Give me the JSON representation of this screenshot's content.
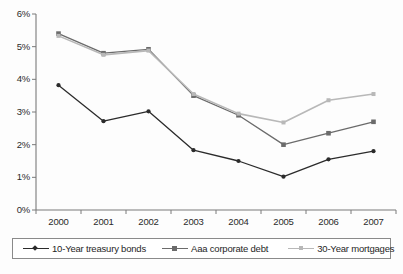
{
  "chart_data": {
    "type": "line",
    "title": "",
    "subtitle": "",
    "xlabel": "",
    "ylabel": "",
    "categories": [
      "2000",
      "2001",
      "2002",
      "2003",
      "2004",
      "2005",
      "2006",
      "2007"
    ],
    "x": [
      2000,
      2001,
      2002,
      2003,
      2004,
      2005,
      2006,
      2007
    ],
    "ylim": [
      0,
      6
    ],
    "yticks": [
      0,
      1,
      2,
      3,
      4,
      5,
      6
    ],
    "ytick_labels": [
      "0%",
      "1%",
      "2%",
      "3%",
      "4%",
      "5%",
      "6%"
    ],
    "grid": false,
    "legend_position": "bottom",
    "series": [
      {
        "name": "10-Year treasury bonds",
        "color": "#2b2b2b",
        "marker": "diamond",
        "values": [
          3.82,
          2.72,
          3.02,
          1.83,
          1.5,
          1.02,
          1.55,
          1.8
        ]
      },
      {
        "name": "Aaa corporate debt",
        "color": "#6b6b6b",
        "marker": "square",
        "values": [
          5.4,
          4.8,
          4.92,
          3.5,
          2.9,
          2.0,
          2.35,
          2.7
        ]
      },
      {
        "name": "30-Year mortgages",
        "color": "#b8b8b8",
        "marker": "square",
        "values": [
          5.33,
          4.75,
          4.88,
          3.55,
          2.95,
          2.68,
          3.36,
          3.55
        ]
      }
    ]
  },
  "axis": {
    "y_tick_labels": [
      "6%",
      "5%",
      "4%",
      "3%",
      "2%",
      "1%",
      "0%"
    ],
    "x_tick_labels": [
      "2000",
      "2001",
      "2002",
      "2003",
      "2004",
      "2005",
      "2006",
      "2007"
    ]
  },
  "legend": {
    "items": [
      {
        "label": "10-Year treasury bonds",
        "color": "#2b2b2b",
        "marker": "diamond"
      },
      {
        "label": "Aaa corporate debt",
        "color": "#6b6b6b",
        "marker": "square"
      },
      {
        "label": "30-Year mortgages",
        "color": "#b8b8b8",
        "marker": "square"
      }
    ]
  },
  "caption": ""
}
